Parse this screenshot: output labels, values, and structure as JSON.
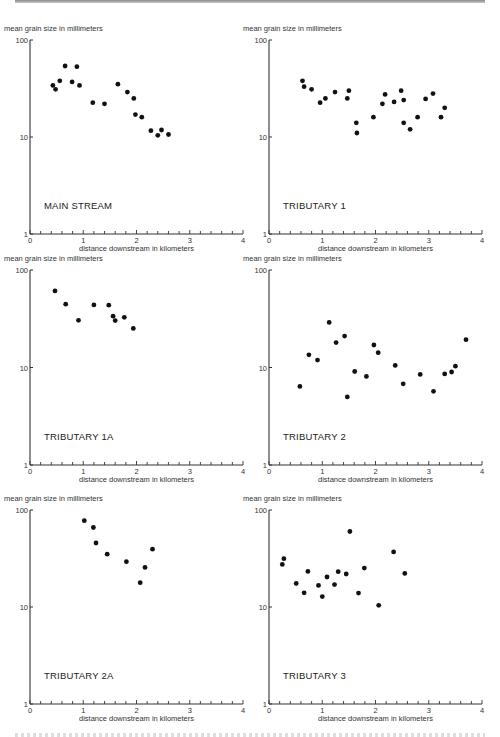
{
  "figure": {
    "y_axis_label": "mean grain size in millimeters",
    "x_axis_label": "distance downstream in kilometers",
    "y_tick_labels": [
      "1",
      "10",
      "100"
    ],
    "x_tick_labels": [
      "0",
      "1",
      "2",
      "3",
      "4"
    ]
  },
  "chart_data": [
    {
      "type": "scatter",
      "title": "MAIN STREAM",
      "xlabel": "distance downstream in kilometers",
      "ylabel": "mean grain size in millimeters",
      "xlim": [
        0,
        4
      ],
      "ylim": [
        1,
        100
      ],
      "yscale": "log",
      "grid": false,
      "points": [
        [
          0.43,
          34
        ],
        [
          0.48,
          31
        ],
        [
          0.56,
          38
        ],
        [
          0.66,
          54
        ],
        [
          0.79,
          37
        ],
        [
          0.88,
          53
        ],
        [
          0.93,
          34
        ],
        [
          1.18,
          22.6
        ],
        [
          1.4,
          22
        ],
        [
          1.65,
          35
        ],
        [
          1.83,
          29
        ],
        [
          1.95,
          25
        ],
        [
          1.98,
          17
        ],
        [
          2.1,
          16
        ],
        [
          2.27,
          11.6
        ],
        [
          2.4,
          10.4
        ],
        [
          2.47,
          11.8
        ],
        [
          2.6,
          10.6
        ]
      ]
    },
    {
      "type": "scatter",
      "title": "TRIBUTARY 1",
      "xlabel": "distance downstream in kilometers",
      "ylabel": "mean grain size in millimeters",
      "xlim": [
        0,
        4
      ],
      "ylim": [
        1,
        100
      ],
      "yscale": "log",
      "grid": false,
      "points": [
        [
          0.63,
          38
        ],
        [
          0.66,
          33
        ],
        [
          0.8,
          31
        ],
        [
          0.96,
          22.6
        ],
        [
          1.06,
          25
        ],
        [
          1.24,
          29
        ],
        [
          1.47,
          25
        ],
        [
          1.5,
          30
        ],
        [
          1.64,
          14
        ],
        [
          1.65,
          11
        ],
        [
          1.96,
          16
        ],
        [
          2.13,
          22
        ],
        [
          2.18,
          27.5
        ],
        [
          2.35,
          23
        ],
        [
          2.48,
          30
        ],
        [
          2.53,
          24
        ],
        [
          2.53,
          14
        ],
        [
          2.65,
          12
        ],
        [
          2.79,
          16
        ],
        [
          2.94,
          24.7
        ],
        [
          3.08,
          28
        ],
        [
          3.23,
          16
        ],
        [
          3.3,
          20
        ]
      ]
    },
    {
      "type": "scatter",
      "title": "TRIBUTARY 1A",
      "xlabel": "distance downstream in kilometers",
      "ylabel": "mean grain size in millimeters",
      "xlim": [
        0,
        4
      ],
      "ylim": [
        1,
        100
      ],
      "yscale": "log",
      "grid": false,
      "points": [
        [
          0.47,
          61
        ],
        [
          0.67,
          44.6
        ],
        [
          0.91,
          30.5
        ],
        [
          1.2,
          43.9
        ],
        [
          1.48,
          43.5
        ],
        [
          1.56,
          33.6
        ],
        [
          1.6,
          30.3
        ],
        [
          1.77,
          32.7
        ],
        [
          1.94,
          25.2
        ]
      ]
    },
    {
      "type": "scatter",
      "title": "TRIBUTARY 2",
      "xlabel": "distance downstream in kilometers",
      "ylabel": "mean grain size in millimeters",
      "xlim": [
        0,
        4
      ],
      "ylim": [
        1,
        100
      ],
      "yscale": "log",
      "grid": false,
      "points": [
        [
          0.58,
          6.4
        ],
        [
          0.75,
          13.5
        ],
        [
          0.91,
          11.9
        ],
        [
          1.13,
          29
        ],
        [
          1.26,
          18
        ],
        [
          1.42,
          21
        ],
        [
          1.47,
          5.0
        ],
        [
          1.61,
          9.1
        ],
        [
          1.83,
          8.1
        ],
        [
          1.97,
          17
        ],
        [
          2.05,
          14.2
        ],
        [
          2.37,
          10.5
        ],
        [
          2.52,
          6.8
        ],
        [
          2.84,
          8.5
        ],
        [
          3.09,
          5.7
        ],
        [
          3.3,
          8.6
        ],
        [
          3.43,
          9.0
        ],
        [
          3.5,
          10.3
        ],
        [
          3.7,
          19.3
        ]
      ]
    },
    {
      "type": "scatter",
      "title": "TRIBUTARY 2A",
      "xlabel": "distance downstream in kilometers",
      "ylabel": "mean grain size in millimeters",
      "xlim": [
        0,
        4
      ],
      "ylim": [
        1,
        100
      ],
      "yscale": "log",
      "grid": false,
      "points": [
        [
          1.02,
          77.6
        ],
        [
          1.19,
          66
        ],
        [
          1.24,
          45.7
        ],
        [
          1.45,
          35
        ],
        [
          1.81,
          29.3
        ],
        [
          2.07,
          17.8
        ],
        [
          2.16,
          25.6
        ],
        [
          2.3,
          39.4
        ]
      ]
    },
    {
      "type": "scatter",
      "title": "TRIBUTARY 3",
      "xlabel": "distance downstream in kilometers",
      "ylabel": "mean grain size in millimeters",
      "xlim": [
        0,
        4
      ],
      "ylim": [
        1,
        100
      ],
      "yscale": "log",
      "grid": false,
      "points": [
        [
          0.25,
          27.5
        ],
        [
          0.28,
          31.5
        ],
        [
          0.51,
          17.5
        ],
        [
          0.66,
          14
        ],
        [
          0.73,
          23.3
        ],
        [
          0.93,
          16.7
        ],
        [
          1.0,
          12.8
        ],
        [
          1.09,
          20.4
        ],
        [
          1.23,
          17
        ],
        [
          1.3,
          23.1
        ],
        [
          1.45,
          21.9
        ],
        [
          1.52,
          60
        ],
        [
          1.68,
          13.9
        ],
        [
          1.79,
          25.2
        ],
        [
          2.06,
          10.4
        ],
        [
          2.34,
          37
        ],
        [
          2.55,
          22.2
        ]
      ]
    }
  ],
  "layout": {
    "panels": [
      {
        "left": 0,
        "top": 8,
        "ax_x0": 30,
        "ax_x4": 243,
        "ax_y100": 32,
        "ax_y1": 226
      },
      {
        "left": 250,
        "top": 8,
        "ax_x0": 19,
        "ax_x4": 232,
        "ax_y100": 32,
        "ax_y1": 226
      },
      {
        "left": 0,
        "top": 248,
        "ax_x0": 30,
        "ax_x4": 243,
        "ax_y100": 22,
        "ax_y1": 217
      },
      {
        "left": 250,
        "top": 248,
        "ax_x0": 19,
        "ax_x4": 232,
        "ax_y100": 22,
        "ax_y1": 217
      },
      {
        "left": 0,
        "top": 488,
        "ax_x0": 30,
        "ax_x4": 243,
        "ax_y100": 22,
        "ax_y1": 216
      },
      {
        "left": 250,
        "top": 488,
        "ax_x0": 19,
        "ax_x4": 232,
        "ax_y100": 22,
        "ax_y1": 216
      }
    ],
    "marker_color": "#111111",
    "axis_color": "#333333"
  }
}
